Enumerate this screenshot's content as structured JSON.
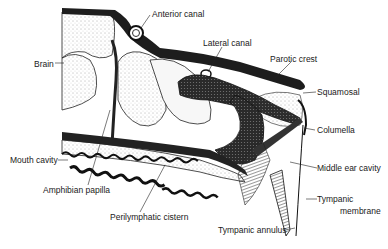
{
  "figure": {
    "labels": {
      "anterior_canal": "Anterior canal",
      "brain": "Brain",
      "lateral_canal": "Lateral canal",
      "parotic_crest": "Parotic crest",
      "squamosal": "Squamosal",
      "columella": "Columella",
      "mouth_cavity": "Mouth cavity",
      "middle_ear_cavity": "Middle ear cavity",
      "amphibian_papilla": "Amphibian papilla",
      "tympanic_membrane_1": "Tympanic",
      "tympanic_membrane_2": "membrane",
      "perilymphatic_cistern": "Perilymphatic cistern",
      "tympanic_annulus": "Tympanic annulus"
    }
  }
}
